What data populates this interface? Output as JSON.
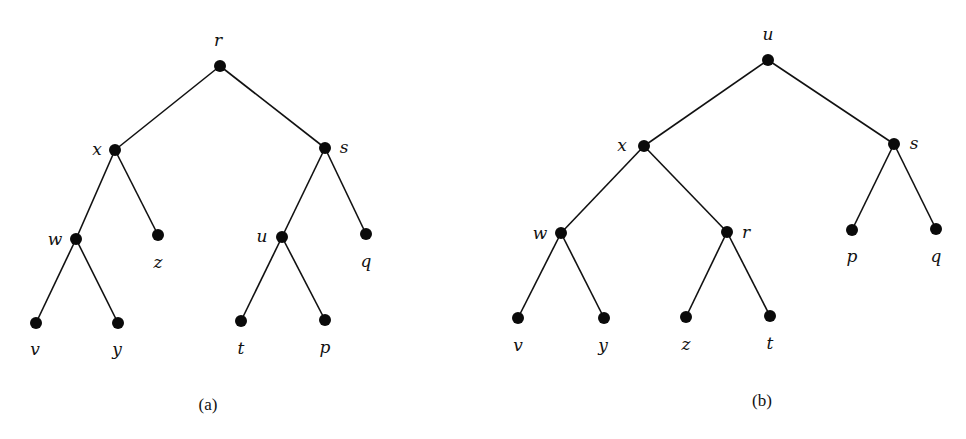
{
  "figure": {
    "panels": [
      {
        "id": "a",
        "caption": "(a)",
        "caption_pos": [
          208,
          410
        ],
        "nodes": [
          {
            "id": "r",
            "label": "r",
            "x": 220,
            "y": 66,
            "lx": 218,
            "ly": 46,
            "anchor": "middle"
          },
          {
            "id": "x",
            "label": "x",
            "x": 115,
            "y": 150,
            "lx": 97,
            "ly": 155,
            "anchor": "middle"
          },
          {
            "id": "s",
            "label": "s",
            "x": 325,
            "y": 148,
            "lx": 344,
            "ly": 153,
            "anchor": "middle"
          },
          {
            "id": "w",
            "label": "w",
            "x": 76,
            "y": 239,
            "lx": 55,
            "ly": 245,
            "anchor": "middle"
          },
          {
            "id": "z",
            "label": "z",
            "x": 158,
            "y": 235,
            "lx": 158,
            "ly": 268,
            "anchor": "middle"
          },
          {
            "id": "u",
            "label": "u",
            "x": 282,
            "y": 237,
            "lx": 262,
            "ly": 242,
            "anchor": "middle"
          },
          {
            "id": "q",
            "label": "q",
            "x": 366,
            "y": 234,
            "lx": 366,
            "ly": 267,
            "anchor": "middle"
          },
          {
            "id": "v",
            "label": "v",
            "x": 36,
            "y": 323,
            "lx": 35,
            "ly": 355,
            "anchor": "middle"
          },
          {
            "id": "y",
            "label": "y",
            "x": 118,
            "y": 323,
            "lx": 117,
            "ly": 355,
            "anchor": "middle"
          },
          {
            "id": "t",
            "label": "t",
            "x": 241,
            "y": 321,
            "lx": 241,
            "ly": 354,
            "anchor": "middle"
          },
          {
            "id": "p",
            "label": "p",
            "x": 325,
            "y": 320,
            "lx": 325,
            "ly": 353,
            "anchor": "middle"
          }
        ],
        "edges": [
          [
            "r",
            "x"
          ],
          [
            "r",
            "s"
          ],
          [
            "x",
            "w"
          ],
          [
            "x",
            "z"
          ],
          [
            "w",
            "v"
          ],
          [
            "w",
            "y"
          ],
          [
            "s",
            "u"
          ],
          [
            "s",
            "q"
          ],
          [
            "u",
            "t"
          ],
          [
            "u",
            "p"
          ]
        ]
      },
      {
        "id": "b",
        "caption": "(b)",
        "caption_pos": [
          762,
          406
        ],
        "nodes": [
          {
            "id": "u",
            "label": "u",
            "x": 768,
            "y": 60,
            "lx": 768,
            "ly": 40,
            "anchor": "middle"
          },
          {
            "id": "x",
            "label": "x",
            "x": 644,
            "y": 146,
            "lx": 622,
            "ly": 151,
            "anchor": "middle"
          },
          {
            "id": "s",
            "label": "s",
            "x": 894,
            "y": 144,
            "lx": 914,
            "ly": 149,
            "anchor": "middle"
          },
          {
            "id": "w",
            "label": "w",
            "x": 561,
            "y": 233,
            "lx": 540,
            "ly": 239,
            "anchor": "middle"
          },
          {
            "id": "r",
            "label": "r",
            "x": 727,
            "y": 232,
            "lx": 746,
            "ly": 238,
            "anchor": "middle"
          },
          {
            "id": "p",
            "label": "p",
            "x": 852,
            "y": 230,
            "lx": 852,
            "ly": 262,
            "anchor": "middle"
          },
          {
            "id": "q",
            "label": "q",
            "x": 936,
            "y": 229,
            "lx": 936,
            "ly": 262,
            "anchor": "middle"
          },
          {
            "id": "v",
            "label": "v",
            "x": 518,
            "y": 318,
            "lx": 518,
            "ly": 351,
            "anchor": "middle"
          },
          {
            "id": "y",
            "label": "y",
            "x": 604,
            "y": 318,
            "lx": 603,
            "ly": 351,
            "anchor": "middle"
          },
          {
            "id": "z",
            "label": "z",
            "x": 686,
            "y": 317,
            "lx": 686,
            "ly": 350,
            "anchor": "middle"
          },
          {
            "id": "t",
            "label": "t",
            "x": 770,
            "y": 316,
            "lx": 770,
            "ly": 349,
            "anchor": "middle"
          }
        ],
        "edges": [
          [
            "u",
            "x"
          ],
          [
            "u",
            "s"
          ],
          [
            "x",
            "w"
          ],
          [
            "x",
            "r"
          ],
          [
            "w",
            "v"
          ],
          [
            "w",
            "y"
          ],
          [
            "r",
            "z"
          ],
          [
            "r",
            "t"
          ],
          [
            "s",
            "p"
          ],
          [
            "s",
            "q"
          ]
        ]
      }
    ],
    "style": {
      "node_color": "#0a0a0a",
      "edge_color": "#111111",
      "background": "#ffffff",
      "node_radius": 6
    }
  }
}
